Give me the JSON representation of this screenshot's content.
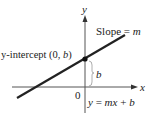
{
  "diagram": {
    "axes": {
      "x_label": "x",
      "y_label": "y",
      "origin_label": "0"
    },
    "labels": {
      "slope_prefix": "Slope = ",
      "slope_var": "m",
      "intercept_prefix": "y-intercept (0, ",
      "intercept_var": "b",
      "intercept_suffix": ")",
      "brace_label": "b",
      "equation_y": "y",
      "equation_eq": " = ",
      "equation_mx": "mx",
      "equation_plus": " + ",
      "equation_b": "b"
    },
    "colors": {
      "line": "#222222",
      "axis": "#555555",
      "brace": "#999999"
    }
  }
}
